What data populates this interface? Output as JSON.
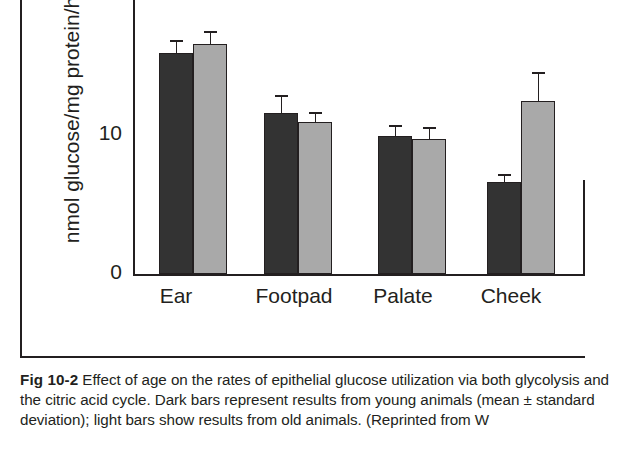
{
  "figure": {
    "label": "Fig 10-2",
    "caption_text": " Effect of age on the rates of epithelial glucose utilization via both glycolysis and the citric acid cycle. Dark bars represent results from young animals (mean ± standard deviation); light bars show results from old animals. (Reprinted from W"
  },
  "chart_data": {
    "type": "bar",
    "title": "",
    "xlabel": "",
    "ylabel": "nmol glucose/mg protein/h",
    "categories": [
      "Ear",
      "Footpad",
      "Palate",
      "Cheek"
    ],
    "ylim": [
      0,
      17.3
    ],
    "yticks": [
      0,
      10
    ],
    "ytick_labels": [
      "0",
      "10"
    ],
    "grid": false,
    "legend": "none",
    "series": [
      {
        "name": "Dark bars (young animals)",
        "color": "#333333",
        "values": [
          15.7,
          11.4,
          9.8,
          6.5
        ],
        "errors": [
          0.9,
          1.3,
          0.8,
          0.6
        ]
      },
      {
        "name": "Light bars (old animals)",
        "color": "#a9a9a9",
        "values": [
          16.3,
          10.8,
          9.6,
          12.3
        ],
        "errors": [
          0.9,
          0.7,
          0.8,
          2.0
        ]
      }
    ]
  },
  "axis": {
    "tick_10": "10",
    "tick_0": "0",
    "y_axis_title": "nmol glucose/mg protein/h",
    "category_0": "Ear",
    "category_1": "Footpad",
    "category_2": "Palate",
    "category_3": "Cheek"
  }
}
